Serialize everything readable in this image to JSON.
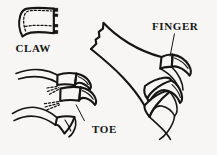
{
  "figure": {
    "background_color": "#f7f6f4",
    "ink_color": "#151515",
    "width": 217,
    "height": 155
  },
  "labels": {
    "claw": "CLAW",
    "toe": "TOE",
    "finger": "FINGER"
  },
  "parts": {
    "claw_sheath": {
      "name": "claw-sheath-detail",
      "description": "curved horny claw sheath shown in isolation, upper left, with dashed inner outline and dark attachment tabs on the right edge"
    },
    "foot": {
      "name": "foot-with-toe-and-claw",
      "description": "bird foot lower left showing two toe segments each ending in a curved claw, dashed lines indicate hidden claw base"
    },
    "wing_hand": {
      "name": "wing-hand-with-finger-claws",
      "description": "wing hand upper right with jagged proximal edge and two clawed fingers"
    }
  },
  "annotations": [
    {
      "label": "CLAW",
      "points_to": "claw-sheath-detail",
      "leader": false
    },
    {
      "label": "TOE",
      "points_to": "foot-with-toe-and-claw",
      "leader": true
    },
    {
      "label": "FINGER",
      "points_to": "wing-hand-with-finger-claws",
      "leader": true
    }
  ],
  "typography": {
    "label_font_size_px": 11,
    "label_font_weight": "bold"
  }
}
